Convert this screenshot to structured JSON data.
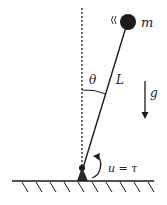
{
  "diagram": {
    "labels": {
      "mass": "m",
      "length": "L",
      "angle": "θ",
      "gravity": "g",
      "input": "u = τ"
    },
    "colors": {
      "stroke": "#1a1a1a",
      "bob": "#1c1c1c",
      "background": "#ffffff"
    }
  }
}
